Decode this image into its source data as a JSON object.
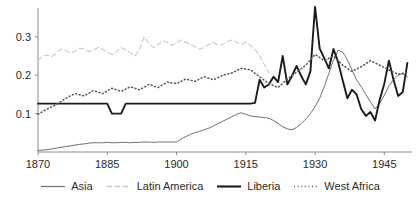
{
  "chart_data": {
    "type": "line",
    "title": "",
    "xlabel": "",
    "ylabel": "",
    "xlim": [
      1870,
      1951
    ],
    "ylim": [
      0.0,
      0.375
    ],
    "xticks": [
      1870,
      1885,
      1900,
      1915,
      1930,
      1945
    ],
    "xtick_labels": [
      "1870",
      "1885",
      "1900",
      "1915",
      "1930",
      "1945"
    ],
    "yticks": [
      0.1,
      0.2,
      0.3
    ],
    "ytick_labels": [
      "0.1",
      "0.2",
      "0.3"
    ],
    "grid": false,
    "legend_position": "bottom-center",
    "series": [
      {
        "name": "Asia",
        "style": "solid-thin",
        "color": "#707070",
        "x": [
          1870,
          1871,
          1872,
          1873,
          1874,
          1875,
          1876,
          1877,
          1878,
          1879,
          1880,
          1881,
          1882,
          1883,
          1884,
          1885,
          1886,
          1887,
          1888,
          1889,
          1890,
          1891,
          1892,
          1893,
          1894,
          1895,
          1896,
          1897,
          1898,
          1899,
          1900,
          1901,
          1902,
          1903,
          1904,
          1905,
          1906,
          1907,
          1908,
          1909,
          1910,
          1911,
          1912,
          1913,
          1914,
          1915,
          1916,
          1917,
          1918,
          1919,
          1920,
          1921,
          1922,
          1923,
          1924,
          1925,
          1926,
          1927,
          1928,
          1929,
          1930,
          1931,
          1932,
          1933,
          1934,
          1935,
          1936,
          1937,
          1938,
          1939,
          1940,
          1941,
          1942,
          1943,
          1944,
          1945,
          1946,
          1947,
          1948,
          1949,
          1950
        ],
        "y": [
          0.004,
          0.005,
          0.006,
          0.008,
          0.01,
          0.012,
          0.014,
          0.016,
          0.018,
          0.02,
          0.021,
          0.023,
          0.024,
          0.024,
          0.024,
          0.025,
          0.024,
          0.024,
          0.025,
          0.025,
          0.024,
          0.025,
          0.025,
          0.026,
          0.026,
          0.025,
          0.026,
          0.026,
          0.026,
          0.026,
          0.026,
          0.034,
          0.04,
          0.046,
          0.05,
          0.054,
          0.058,
          0.062,
          0.068,
          0.074,
          0.08,
          0.086,
          0.092,
          0.098,
          0.102,
          0.098,
          0.094,
          0.092,
          0.091,
          0.09,
          0.088,
          0.082,
          0.074,
          0.066,
          0.06,
          0.058,
          0.064,
          0.074,
          0.086,
          0.1,
          0.118,
          0.14,
          0.17,
          0.205,
          0.24,
          0.265,
          0.26,
          0.24,
          0.214,
          0.188,
          0.17,
          0.15,
          0.13,
          0.112,
          0.126,
          0.148,
          0.172,
          0.188,
          0.2,
          0.204,
          0.196
        ]
      },
      {
        "name": "Latin America",
        "style": "dashed",
        "color": "#c9c9c9",
        "x": [
          1870,
          1871,
          1872,
          1873,
          1874,
          1875,
          1876,
          1877,
          1878,
          1879,
          1880,
          1881,
          1882,
          1883,
          1884,
          1885,
          1886,
          1887,
          1888,
          1889,
          1890,
          1891,
          1892,
          1893,
          1894,
          1895,
          1896,
          1897,
          1898,
          1899,
          1900,
          1901,
          1902,
          1903,
          1904,
          1905,
          1906,
          1907,
          1908,
          1909,
          1910,
          1911,
          1912,
          1913,
          1914,
          1915,
          1916,
          1917,
          1918,
          1919,
          1920
        ],
        "y": [
          0.238,
          0.25,
          0.252,
          0.248,
          0.258,
          0.268,
          0.264,
          0.258,
          0.262,
          0.27,
          0.268,
          0.262,
          0.265,
          0.272,
          0.268,
          0.26,
          0.254,
          0.262,
          0.272,
          0.266,
          0.258,
          0.25,
          0.268,
          0.3,
          0.282,
          0.272,
          0.28,
          0.29,
          0.286,
          0.278,
          0.284,
          0.292,
          0.286,
          0.28,
          0.274,
          0.268,
          0.272,
          0.28,
          0.286,
          0.278,
          0.28,
          0.288,
          0.292,
          0.286,
          0.28,
          0.286,
          0.278,
          0.268,
          0.25,
          0.228,
          0.206
        ]
      },
      {
        "name": "Liberia",
        "style": "solid-thick",
        "color": "#1b1b1b",
        "x": [
          1870,
          1880,
          1885,
          1886,
          1887,
          1888,
          1889,
          1915,
          1916,
          1917,
          1918,
          1919,
          1920,
          1921,
          1922,
          1923,
          1924,
          1925,
          1926,
          1927,
          1928,
          1929,
          1930,
          1931,
          1932,
          1933,
          1934,
          1935,
          1936,
          1937,
          1938,
          1939,
          1940,
          1941,
          1942,
          1943,
          1944,
          1945,
          1946,
          1947,
          1948,
          1949,
          1950
        ],
        "y": [
          0.126,
          0.126,
          0.126,
          0.1,
          0.1,
          0.1,
          0.126,
          0.126,
          0.126,
          0.128,
          0.188,
          0.168,
          0.176,
          0.196,
          0.182,
          0.25,
          0.176,
          0.198,
          0.224,
          0.198,
          0.176,
          0.21,
          0.378,
          0.27,
          0.244,
          0.218,
          0.268,
          0.234,
          0.186,
          0.14,
          0.162,
          0.15,
          0.112,
          0.094,
          0.104,
          0.082,
          0.136,
          0.178,
          0.238,
          0.188,
          0.146,
          0.156,
          0.232
        ]
      },
      {
        "name": "West Africa",
        "style": "dotted",
        "color": "#555555",
        "x": [
          1870,
          1872,
          1874,
          1876,
          1878,
          1880,
          1882,
          1884,
          1886,
          1888,
          1890,
          1892,
          1894,
          1896,
          1898,
          1900,
          1902,
          1904,
          1906,
          1908,
          1910,
          1912,
          1914,
          1916,
          1918,
          1920,
          1922,
          1924,
          1926,
          1928,
          1930,
          1932,
          1934,
          1936,
          1938,
          1940,
          1942,
          1944,
          1946,
          1948,
          1950
        ],
        "y": [
          0.098,
          0.112,
          0.124,
          0.14,
          0.152,
          0.146,
          0.16,
          0.152,
          0.166,
          0.158,
          0.17,
          0.162,
          0.176,
          0.168,
          0.182,
          0.178,
          0.19,
          0.184,
          0.196,
          0.188,
          0.2,
          0.206,
          0.218,
          0.214,
          0.196,
          0.178,
          0.168,
          0.19,
          0.208,
          0.226,
          0.254,
          0.238,
          0.25,
          0.226,
          0.21,
          0.222,
          0.238,
          0.226,
          0.214,
          0.202,
          0.208
        ]
      }
    ]
  },
  "axes": {
    "ytick_labels": [
      "0.3",
      "0.2",
      "0.1"
    ],
    "xtick_labels": [
      "1870",
      "1885",
      "1900",
      "1915",
      "1930",
      "1945"
    ]
  },
  "legend": {
    "items": [
      {
        "label": "Asia",
        "swatch": "line-solid-thin-gray"
      },
      {
        "label": "Latin America",
        "swatch": "line-dashed-light"
      },
      {
        "label": "Liberia",
        "swatch": "line-solid-thick-black"
      },
      {
        "label": "West Africa",
        "swatch": "line-dotted"
      }
    ]
  }
}
